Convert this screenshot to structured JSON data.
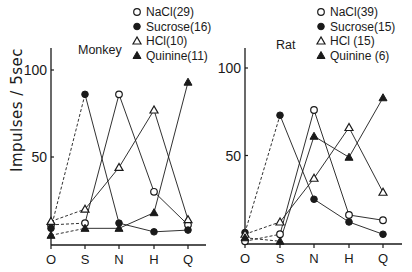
{
  "chart_data": [
    {
      "type": "line",
      "title": "Monkey",
      "xlabel": "",
      "ylabel": "Impulses / 5sec",
      "categories": [
        "O",
        "S",
        "N",
        "H",
        "Q"
      ],
      "yticks": [
        50,
        100
      ],
      "ylim": [
        0,
        100
      ],
      "grid": false,
      "legend_position": "top-right",
      "note": "O→S segments drawn dashed; remaining segments solid",
      "series": [
        {
          "name": "NaCl(29)",
          "marker": "open-circle",
          "values": [
            11,
            12,
            86,
            30,
            11
          ]
        },
        {
          "name": "Sucrose(16)",
          "marker": "filled-circle",
          "values": [
            9,
            86,
            12,
            7,
            8
          ]
        },
        {
          "name": "HCl(10)",
          "marker": "open-triangle",
          "values": [
            13,
            20,
            44,
            77,
            14
          ]
        },
        {
          "name": "Quinine(11)",
          "marker": "filled-triangle",
          "values": [
            5,
            9,
            9,
            18,
            93
          ]
        }
      ]
    },
    {
      "type": "line",
      "title": "Rat",
      "xlabel": "",
      "ylabel": "",
      "categories": [
        "O",
        "S",
        "N",
        "H",
        "Q"
      ],
      "yticks": [
        50,
        100
      ],
      "ylim": [
        0,
        100
      ],
      "grid": false,
      "legend_position": "top-right",
      "note": "O→S segments drawn dashed; remaining segments solid",
      "series": [
        {
          "name": "NaCl(39)",
          "marker": "open-circle",
          "values": [
            1,
            5,
            76,
            16,
            13
          ]
        },
        {
          "name": "Sucrose(15)",
          "marker": "filled-circle",
          "values": [
            6,
            73,
            25,
            12,
            5
          ]
        },
        {
          "name": "HCl (15)",
          "marker": "open-triangle",
          "values": [
            5,
            12,
            37,
            66,
            29
          ]
        },
        {
          "name": "Quinine (6)",
          "marker": "filled-triangle",
          "values": [
            3,
            1,
            61,
            49,
            83
          ]
        }
      ]
    }
  ],
  "ylabel_text": "Impulses / 5sec"
}
